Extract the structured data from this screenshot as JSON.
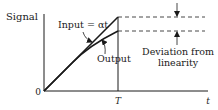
{
  "diagram": {
    "y_axis_label": "Signal",
    "x_axis_label": "t",
    "origin_label": "0",
    "time_marker_label": "T",
    "input_label": "Input = αt",
    "output_label": "Output",
    "deviation_label_line1": "Deviation from",
    "deviation_label_line2": "linearity",
    "colors": {
      "ink": "#1a1a1a",
      "background": "#ffffff"
    }
  }
}
